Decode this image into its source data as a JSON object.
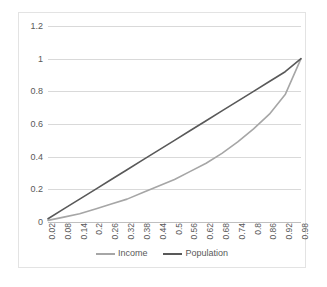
{
  "chart_data": {
    "type": "line",
    "title": "",
    "xlabel": "",
    "ylabel": "",
    "ylim": [
      0,
      1.2
    ],
    "grid": true,
    "legend_position": "bottom",
    "y_ticks": [
      "0",
      "0.2",
      "0.4",
      "0.6",
      "0.8",
      "1",
      "1.2"
    ],
    "y_tick_values": [
      0,
      0.2,
      0.4,
      0.6,
      0.8,
      1,
      1.2
    ],
    "categories": [
      "0.02",
      "0.08",
      "0.14",
      "0.2",
      "0.26",
      "0.32",
      "0.38",
      "0.44",
      "0.5",
      "0.56",
      "0.62",
      "0.68",
      "0.74",
      "0.8",
      "0.86",
      "0.92",
      "0.98"
    ],
    "x": [
      0.02,
      0.08,
      0.14,
      0.2,
      0.26,
      0.32,
      0.38,
      0.44,
      0.5,
      0.56,
      0.62,
      0.68,
      0.74,
      0.8,
      0.86,
      0.92,
      0.98
    ],
    "series": [
      {
        "name": "Income",
        "color": "#a6a6a6",
        "values": [
          0.01,
          0.03,
          0.05,
          0.08,
          0.11,
          0.14,
          0.18,
          0.22,
          0.26,
          0.31,
          0.36,
          0.42,
          0.49,
          0.57,
          0.66,
          0.78,
          1.0
        ]
      },
      {
        "name": "Population",
        "color": "#595959",
        "values": [
          0.02,
          0.08,
          0.14,
          0.2,
          0.26,
          0.32,
          0.38,
          0.44,
          0.5,
          0.56,
          0.62,
          0.68,
          0.74,
          0.8,
          0.86,
          0.92,
          1.0
        ]
      }
    ]
  },
  "legend": {
    "items": [
      {
        "label": "Income",
        "color": "#a6a6a6"
      },
      {
        "label": "Population",
        "color": "#595959"
      }
    ]
  },
  "colors": {
    "income": "#a6a6a6",
    "population": "#595959",
    "gridline": "#d9d9d9",
    "axis": "#bfbfbf",
    "frame": "#e3e3e3",
    "tick_text": "#595959",
    "background": "#ffffff"
  }
}
